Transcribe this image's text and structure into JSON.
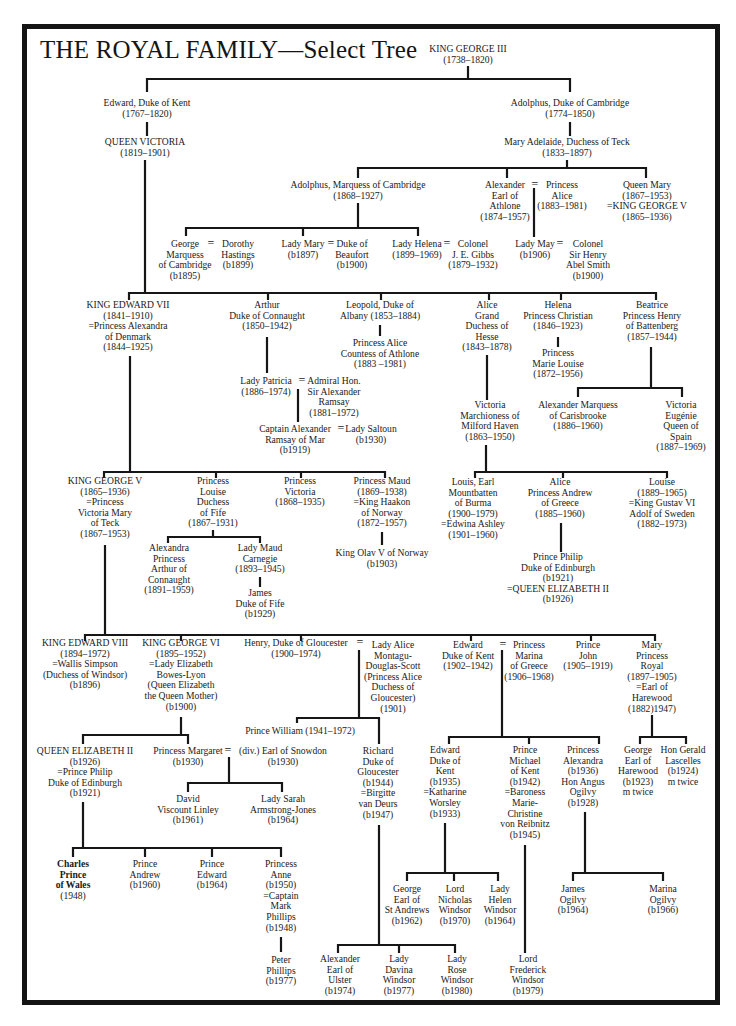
{
  "title": "THE ROYAL FAMILY—Select Tree",
  "symbols": {
    "married": "="
  },
  "nodes": {
    "george3": "KING GEORGE III\n(1738–1820)",
    "edward_kent": "Edward, Duke of Kent\n(1767–1820)",
    "victoria": "QUEEN VICTORIA\n(1819–1901)",
    "adolphus_cambridge": "Adolphus, Duke of Cambridge\n(1774–1850)",
    "mary_adelaide": "Mary Adelaide, Duchess of Teck\n(1833–1897)",
    "adolphus_marquess": "Adolphus, Marquess of Cambridge\n(1868–1927)",
    "alexander_athlone": "Alexander\nEarl of\nAthlone\n(1874–1957)",
    "princess_alice_athlone": "Princess\nAlice\n(1883–1981)",
    "queen_mary": "Queen Mary\n(1867–1953)\n=KING GEORGE V\n(1865–1936)",
    "george_cambridge": "George\nMarquess\nof Cambridge\n(b1895)",
    "dorothy_hastings": "Dorothy\nHastings\n(b1899)",
    "lady_mary": "Lady Mary\n(b1897)",
    "duke_beaufort": "Duke of\nBeaufort\n(b1900)",
    "lady_helena": "Lady Helena\n(1899–1969)",
    "colonel_gibbs": "Colonel\nJ. E. Gibbs\n(1879–1932)",
    "lady_may": "Lady May\n(b1906)",
    "colonel_abel_smith": "Colonel\nSir Henry\nAbel Smith\n(b1900)",
    "edward7": "KING EDWARD VII\n(1841–1910)\n=Princess Alexandra\nof Denmark\n(1844–1925)",
    "arthur": "Arthur\nDuke of Connaught\n(1850–1942)",
    "leopold": "Leopold, Duke of\nAlbany (1853–1884)",
    "princess_alice_countess": "Princess Alice\nCountess of Athlone\n(1883 –1981)",
    "alice_hesse": "Alice\nGrand\nDuchess of\nHesse\n(1843–1878)",
    "helena": "Helena\nPrincess Christian\n(1846–1923)",
    "marie_louise": "Princess\nMarie Louise\n(1872–1956)",
    "beatrice": "Beatrice\nPrincess Henry\nof Battenberg\n(1857–1944)",
    "lady_patricia": "Lady Patricia\n(1886–1974)",
    "admiral_ramsay": "Admiral Hon.\nSir Alexander\nRamsay\n(1881–1972)",
    "captain_alexander": "Captain Alexander\nRamsay of Mar\n(b1919)",
    "lady_saltoun": "Lady Saltoun\n(b1930)",
    "victoria_milford": "Victoria\nMarchioness of\nMilford Haven\n(1863–1950)",
    "alexander_carisbrooke": "Alexander Marquess\nof Carisbrooke\n(1886–1960)",
    "victoria_eugenie": "Victoria\nEugénie\nQueen of\nSpain\n(1887–1969)",
    "george5": "KING GEORGE V\n(1865–1936)\n=Princess\nVictoria Mary\nof Teck\n(1867–1953)",
    "louise_fife": "Princess\nLouise\nDuchess\nof Fife\n(1867–1931)",
    "princess_victoria": "Princess\nVictoria\n(1868–1935)",
    "princess_maud": "Princess Maud\n(1869–1938)\n=King Haakon\nof Norway\n(1872–1957)",
    "king_olav": "King Olav V of Norway\n(b1903)",
    "alexandra_arthur": "Alexandra\nPrincess\nArthur of\nConnaught\n(1891–1959)",
    "lady_maud": "Lady Maud\nCarnegie\n(1893–1945)",
    "james_fife": "James\nDuke of Fife\n(b1929)",
    "louis_mountbatten": "Louis, Earl\nMountbatten\nof Burma\n(1900–1979)\n=Edwina Ashley\n(1901–1960)",
    "alice_andrew": "Alice\nPrincess Andrew\nof Greece\n(1885–1960)",
    "louise_sweden": "Louise\n(1889–1965)\n=King Gustav VI\nAdolf of Sweden\n(1882–1973)",
    "prince_philip": "Prince Philip\nDuke of Edinburgh\n(b1921)\n=QUEEN ELIZABETH II\n(b1926)",
    "edward8": "KING EDWARD VIII\n(1894–1972)\n=Wallis Simpson\n(Duchess of Windsor)\n(b1896)",
    "george6": "KING GEORGE VI\n(1895–1952)\n=Lady Elizabeth\nBowes-Lyon\n(Queen Elizabeth\nthe Queen Mother)\n(b1900)",
    "henry_gloucester": "Henry, Duke of Gloucester\n(1900–1974)",
    "lady_alice_gloucester": "Lady Alice\nMontagu-\nDouglas-Scott\n(Princess Alice\nDuchess of\nGloucester)\n(1901)",
    "edward_kent_1902": "Edward\nDuke of Kent\n(1902–1942)",
    "princess_marina": "Princess\nMarina\nof Greece\n(1906–1968)",
    "prince_john": "Prince\nJohn\n(1905–1919)",
    "mary_princess_royal": "Mary\nPrincess\nRoyal\n(1897–1905)\n=Earl of\nHarewood\n(1882)1947)",
    "queen_elizabeth2": "QUEEN ELIZABETH II\n(b1926)\n=Prince Philip\nDuke of Edinburgh\n(b1921)",
    "princess_margaret": "Princess Margaret\n(b1930)",
    "earl_snowdon": "(div.) Earl of Snowdon\n(b1930)",
    "prince_william_gloucester": "Prince William (1941–1972)",
    "richard_gloucester": "Richard\nDuke of\nGloucester\n(b1944)\n=Birgitte\nvan Deurs\n(b1947)",
    "edward_kent_1935": "Edward\nDuke of\nKent\n(b1935)\n=Katharine\nWorsley\n(b1933)",
    "prince_michael": "Prince\nMichael\nof Kent\n(b1942)\n=Baroness\nMarie-\nChristine\nvon Reibnitz\n(b1945)",
    "princess_alexandra": "Princess\nAlexandra\n(b1936)\nHon Angus\nOgilvy\n(b1928)",
    "george_harewood": "George\nEarl of\nHarewood\n(b1923)\nm twice",
    "gerald_lascelles": "Hon Gerald\nLascelles\n(b1924)\nm twice",
    "david_linley": "David\nViscount Linley\n(b1961)",
    "sarah_armstrong_jones": "Lady Sarah\nArmstrong-Jones\n(b1964)",
    "charles_name": "Charles\nPrince\nof Wales",
    "charles_dates": "(1948)",
    "prince_andrew": "Prince\nAndrew\n(b1960)",
    "prince_edward": "Prince\nEdward\n(b1964)",
    "princess_anne": "Princess\nAnne\n(b1950)\n=Captain\nMark\nPhillips\n(b1948)",
    "peter_phillips": "Peter\nPhillips\n(b1977)",
    "george_st_andrews": "George\nEarl of\nSt Andrews\n(b1962)",
    "nicholas_windsor": "Lord\nNicholas\nWindsor\n(b1970)",
    "helen_windsor": "Lady\nHelen\nWindsor\n(b1964)",
    "james_ogilvy": "James\nOgilvy\n(b1964)",
    "marina_ogilvy": "Marina\nOgilvy\n(b1966)",
    "alexander_ulster": "Alexander\nEarl of\nUlster\n(b1974)",
    "davina_windsor": "Lady\nDavina\nWindsor\n(b1977)",
    "rose_windsor": "Lady\nRose\nWindsor\n(b1980)",
    "frederick_windsor": "Lord\nFrederick\nWindsor\n(b1979)"
  }
}
